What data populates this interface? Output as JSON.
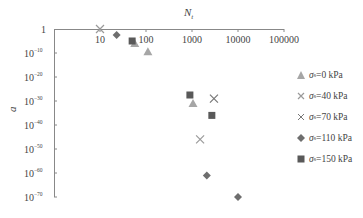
{
  "chart_data": {
    "type": "scatter",
    "title": "",
    "xlabel": "N_t",
    "ylabel": "a",
    "x_scale": "log",
    "y_scale": "log",
    "xlim": [
      1,
      100000
    ],
    "ylim": [
      1e-70,
      1
    ],
    "x_ticks": [
      "10",
      "100",
      "1000",
      "10000",
      "100000"
    ],
    "y_ticks": [
      "1",
      "10^-10",
      "10^-20",
      "10^-30",
      "10^-40",
      "10^-50",
      "10^-60",
      "10^-70"
    ],
    "x_axis_position": "top",
    "grid": false,
    "legend_position": "right",
    "series": [
      {
        "name": "σs=0 kPa",
        "marker": "triangle",
        "color": "#a6a6a6",
        "points": [
          {
            "x": 57,
            "y_exp": -6
          },
          {
            "x": 110,
            "y_exp": -9.5
          },
          {
            "x": 1050,
            "y_exp": -31
          }
        ]
      },
      {
        "name": "σs=40 kPa",
        "marker": "x",
        "color": "#9a9a9a",
        "points": [
          {
            "x": 10,
            "y_exp": 0
          },
          {
            "x": 1500,
            "y_exp": -46
          }
        ]
      },
      {
        "name": "σs=70 kPa",
        "marker": "x",
        "color": "#777777",
        "points": [
          {
            "x": 3000,
            "y_exp": -29
          }
        ]
      },
      {
        "name": "σs=110 kPa",
        "marker": "diamond",
        "color": "#6e6e6e",
        "points": [
          {
            "x": 23,
            "y_exp": -2.5
          },
          {
            "x": 2100,
            "y_exp": -61
          },
          {
            "x": 10000,
            "y_exp": -70
          }
        ]
      },
      {
        "name": "σs=150 kPa",
        "marker": "square",
        "color": "#595959",
        "points": [
          {
            "x": 50,
            "y_exp": -5
          },
          {
            "x": 900,
            "y_exp": -27.5
          },
          {
            "x": 2700,
            "y_exp": -36
          }
        ]
      }
    ]
  },
  "labels": {
    "x_axis": "N",
    "x_axis_sub": "t",
    "y_axis": "a",
    "y_tick_one": "1",
    "y_tick_base": "10",
    "y_tick_exps": [
      "−10",
      "−20",
      "−30",
      "−40",
      "−50",
      "−60",
      "−70"
    ]
  },
  "legend": [
    {
      "prefix": "σ",
      "sub": "s",
      "text": "=0 kPa"
    },
    {
      "prefix": "σ",
      "sub": "s",
      "text": "=40 kPa"
    },
    {
      "prefix": "σ",
      "sub": "s",
      "text": "=70 kPa"
    },
    {
      "prefix": "σ",
      "sub": "s",
      "text": "=110 kPa"
    },
    {
      "prefix": "σ",
      "sub": "s",
      "text": "=150 kPa"
    }
  ]
}
